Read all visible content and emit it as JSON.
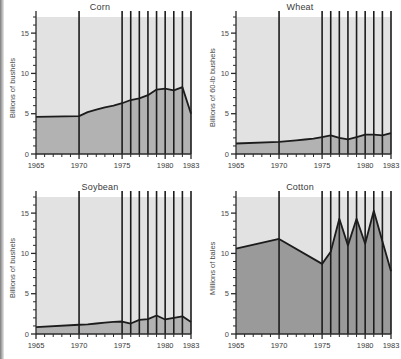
{
  "figure": {
    "kind": "small-multiples",
    "panel_count": 4,
    "colors": {
      "above_fill": "#e2e2e2",
      "below_fill": "#b2b2b2",
      "below_fill_dark": "#9a9a9a",
      "line": "#1c1c1c",
      "axis": "#2a2a2a",
      "text": "#3a3a3a"
    }
  },
  "chart_data": [
    {
      "type": "area",
      "title": "Corn",
      "xlabel": "",
      "ylabel": "Billions of bushels",
      "xlim": [
        1965,
        1983
      ],
      "ylim": [
        0,
        17
      ],
      "yticks": [
        0,
        5,
        10,
        15
      ],
      "yticklabels": [
        "0",
        "5",
        "10",
        "15"
      ],
      "yminorticks": [
        1,
        2,
        3,
        4,
        6,
        7,
        8,
        9,
        11,
        12,
        13,
        14,
        16,
        17
      ],
      "xticks": [
        1965,
        1970,
        1975,
        1980,
        1983
      ],
      "xticklabels": [
        "1965",
        "1970",
        "1975",
        "1980",
        "1983"
      ],
      "grid": false,
      "vlines": [
        1970,
        1975,
        1976,
        1977,
        1978,
        1979,
        1980,
        1981,
        1982,
        1983
      ],
      "x": [
        1965,
        1970,
        1971,
        1972,
        1973,
        1974,
        1975,
        1976,
        1977,
        1978,
        1979,
        1980,
        1981,
        1982,
        1983
      ],
      "values": [
        4.6,
        4.7,
        5.2,
        5.5,
        5.8,
        6.0,
        6.3,
        6.7,
        6.9,
        7.3,
        8.0,
        8.1,
        7.9,
        8.3,
        5.0
      ]
    },
    {
      "type": "area",
      "title": "Wheat",
      "xlabel": "",
      "ylabel": "Billions of 60-lb bushels",
      "xlim": [
        1965,
        1983
      ],
      "ylim": [
        0,
        17
      ],
      "yticks": [
        0,
        5,
        10,
        15
      ],
      "yticklabels": [
        "0",
        "5",
        "10",
        "15"
      ],
      "yminorticks": [
        1,
        2,
        3,
        4,
        6,
        7,
        8,
        9,
        11,
        12,
        13,
        14,
        16,
        17
      ],
      "xticks": [
        1965,
        1970,
        1975,
        1980,
        1983
      ],
      "xticklabels": [
        "1965",
        "1970",
        "1975",
        "1980",
        "1983"
      ],
      "grid": false,
      "vlines": [
        1970,
        1975,
        1976,
        1977,
        1978,
        1979,
        1980,
        1981,
        1982,
        1983
      ],
      "x": [
        1965,
        1970,
        1971,
        1972,
        1973,
        1974,
        1975,
        1976,
        1977,
        1978,
        1979,
        1980,
        1981,
        1982,
        1983
      ],
      "values": [
        1.3,
        1.5,
        1.6,
        1.7,
        1.8,
        1.9,
        2.1,
        2.3,
        2.0,
        1.8,
        2.1,
        2.4,
        2.4,
        2.3,
        2.6
      ]
    },
    {
      "type": "area",
      "title": "Soybean",
      "xlabel": "",
      "ylabel": "Billions of bushels",
      "xlim": [
        1965,
        1983
      ],
      "ylim": [
        0,
        17
      ],
      "yticks": [
        0,
        5,
        10,
        15
      ],
      "yticklabels": [
        "0",
        "5",
        "10",
        "15"
      ],
      "yminorticks": [
        1,
        2,
        3,
        4,
        6,
        7,
        8,
        9,
        11,
        12,
        13,
        14,
        16,
        17
      ],
      "xticks": [
        1965,
        1970,
        1975,
        1980,
        1983
      ],
      "xticklabels": [
        "1965",
        "1970",
        "1975",
        "1980",
        "1983"
      ],
      "grid": false,
      "vlines": [
        1970,
        1975,
        1976,
        1977,
        1978,
        1979,
        1980,
        1981,
        1982,
        1983
      ],
      "x": [
        1965,
        1970,
        1971,
        1972,
        1973,
        1974,
        1975,
        1976,
        1977,
        1978,
        1979,
        1980,
        1981,
        1982,
        1983
      ],
      "values": [
        0.85,
        1.15,
        1.2,
        1.3,
        1.4,
        1.5,
        1.55,
        1.3,
        1.75,
        1.85,
        2.3,
        1.8,
        2.0,
        2.2,
        1.5
      ]
    },
    {
      "type": "area",
      "title": "Cotton",
      "xlabel": "",
      "ylabel": "Millions of bales",
      "xlim": [
        1965,
        1983
      ],
      "ylim": [
        0,
        17
      ],
      "yticks": [
        0,
        5,
        10,
        15
      ],
      "yticklabels": [
        "0",
        "5",
        "10",
        "15"
      ],
      "yminorticks": [
        1,
        2,
        3,
        4,
        6,
        7,
        8,
        9,
        11,
        12,
        13,
        14,
        16,
        17
      ],
      "xticks": [
        1965,
        1970,
        1975,
        1980,
        1983
      ],
      "xticklabels": [
        "1965",
        "1970",
        "1975",
        "1980",
        "1983"
      ],
      "grid": false,
      "vlines": [
        1970,
        1975,
        1976,
        1977,
        1978,
        1979,
        1980,
        1981,
        1982,
        1983
      ],
      "x": [
        1965,
        1970,
        1975,
        1976,
        1977,
        1978,
        1979,
        1980,
        1981,
        1982,
        1983
      ],
      "values": [
        10.6,
        11.8,
        8.7,
        10.2,
        14.3,
        11.0,
        14.3,
        11.2,
        15.3,
        11.5,
        7.8
      ]
    }
  ]
}
